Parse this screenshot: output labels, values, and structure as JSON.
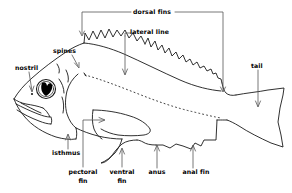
{
  "diagram": {
    "title": "",
    "line_color": "#1a1a1a",
    "text_color": "#000000",
    "background": "#ffffff",
    "labels": [
      {
        "id": "dorsal-fins",
        "text": "dorsal fins",
        "x": 152,
        "y": 12,
        "lines": [
          "dorsal fins"
        ]
      },
      {
        "id": "lateral-line",
        "text": "lateral line",
        "x": 152,
        "y": 32,
        "lines": [
          "lateral line"
        ]
      },
      {
        "id": "spines",
        "text": "spines",
        "x": 67,
        "y": 51,
        "lines": [
          "spines"
        ]
      },
      {
        "id": "nostril",
        "text": "nostril",
        "x": 29,
        "y": 68,
        "lines": [
          "nostril"
        ]
      },
      {
        "id": "tail",
        "text": "tail",
        "x": 258,
        "y": 66,
        "lines": [
          "tail"
        ]
      },
      {
        "id": "isthmus",
        "text": "isthmus",
        "x": 68,
        "y": 153,
        "lines": [
          "isthmus"
        ]
      },
      {
        "id": "pectoral-fin",
        "text": "pectoral fin",
        "x": 83,
        "y": 172,
        "lines": [
          "pectoral",
          "fin"
        ]
      },
      {
        "id": "ventral-fin",
        "text": "ventral fin",
        "x": 122,
        "y": 172,
        "lines": [
          "ventral",
          "fin"
        ]
      },
      {
        "id": "anus",
        "text": "anus",
        "x": 157,
        "y": 172,
        "lines": [
          "anus"
        ]
      },
      {
        "id": "anal-fin",
        "text": "anal fin",
        "x": 196,
        "y": 172,
        "lines": [
          "anal fin"
        ]
      }
    ]
  }
}
